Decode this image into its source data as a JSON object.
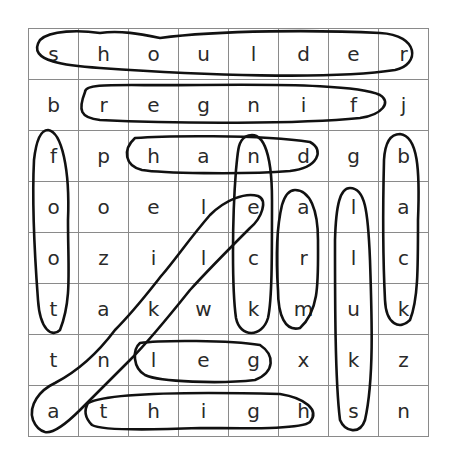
{
  "puzzle": {
    "rows": 8,
    "cols": 8,
    "grid": [
      [
        "s",
        "h",
        "o",
        "u",
        "l",
        "d",
        "e",
        "r"
      ],
      [
        "b",
        "r",
        "e",
        "g",
        "n",
        "i",
        "f",
        "j"
      ],
      [
        "f",
        "p",
        "h",
        "a",
        "n",
        "d",
        "g",
        "b"
      ],
      [
        "o",
        "o",
        "e",
        "l",
        "e",
        "a",
        "l",
        "a"
      ],
      [
        "o",
        "z",
        "i",
        "l",
        "c",
        "r",
        "l",
        "c"
      ],
      [
        "t",
        "a",
        "k",
        "w",
        "k",
        "m",
        "u",
        "k"
      ],
      [
        "t",
        "n",
        "l",
        "e",
        "g",
        "x",
        "k",
        "z"
      ],
      [
        "a",
        "t",
        "h",
        "i",
        "g",
        "h",
        "s",
        "n"
      ]
    ],
    "found_words": [
      {
        "word": "shoulder",
        "direction": "horizontal",
        "start": [
          0,
          0
        ],
        "end": [
          0,
          7
        ]
      },
      {
        "word": "finger",
        "direction": "horizontal-reversed",
        "start": [
          1,
          6
        ],
        "end": [
          1,
          1
        ]
      },
      {
        "word": "hand",
        "direction": "horizontal",
        "start": [
          2,
          2
        ],
        "end": [
          2,
          5
        ]
      },
      {
        "word": "neck",
        "direction": "vertical",
        "start": [
          2,
          4
        ],
        "end": [
          5,
          4
        ]
      },
      {
        "word": "back",
        "direction": "vertical",
        "start": [
          2,
          7
        ],
        "end": [
          5,
          7
        ]
      },
      {
        "word": "foot",
        "direction": "vertical",
        "start": [
          2,
          0
        ],
        "end": [
          5,
          0
        ]
      },
      {
        "word": "arm",
        "direction": "vertical",
        "start": [
          3,
          5
        ],
        "end": [
          5,
          5
        ]
      },
      {
        "word": "skull",
        "direction": "vertical-reversed",
        "start": [
          7,
          6
        ],
        "end": [
          3,
          6
        ]
      },
      {
        "word": "ankle",
        "direction": "diagonal",
        "start": [
          7,
          0
        ],
        "end": [
          3,
          4
        ]
      },
      {
        "word": "leg",
        "direction": "horizontal",
        "start": [
          6,
          2
        ],
        "end": [
          6,
          4
        ]
      },
      {
        "word": "thigh",
        "direction": "horizontal",
        "start": [
          7,
          1
        ],
        "end": [
          7,
          5
        ]
      }
    ]
  }
}
